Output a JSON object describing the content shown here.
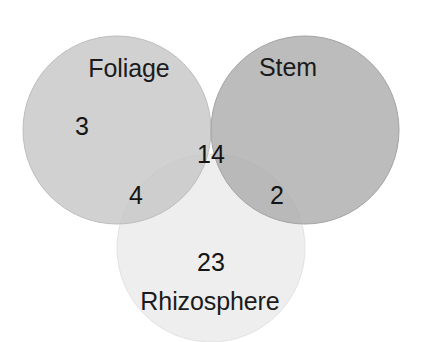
{
  "figure": {
    "type": "venn-diagram",
    "width": 421,
    "height": 342,
    "background_color": "#ffffff"
  },
  "chart_data": {
    "type": "venn",
    "title": "",
    "xlabel": "",
    "ylabel": "",
    "grid": false,
    "legend_position": "none",
    "sets": [
      {
        "key": "foliage",
        "label": "Foliage",
        "color": "#c9c9c9",
        "center": [
          117,
          130
        ],
        "radius": 94,
        "exclusive_count": 3
      },
      {
        "key": "stem",
        "label": "Stem",
        "color": "#b4b4b4",
        "center": [
          305,
          130
        ],
        "radius": 94,
        "exclusive_count": null
      },
      {
        "key": "rhizosphere",
        "label": "Rhizosphere",
        "color": "#f0f0f0",
        "center": [
          211,
          248
        ],
        "radius": 94,
        "exclusive_count": 23
      }
    ],
    "regions": [
      {
        "key": "foliage-only",
        "sets": [
          "foliage"
        ],
        "value": 3,
        "position": [
          82,
          126
        ]
      },
      {
        "key": "foliage-rhizosphere",
        "sets": [
          "foliage",
          "rhizosphere"
        ],
        "value": 4,
        "position": [
          136,
          195
        ]
      },
      {
        "key": "foliage-stem-rhizosphere",
        "sets": [
          "foliage",
          "stem",
          "rhizosphere"
        ],
        "value": 14,
        "position": [
          211,
          154
        ]
      },
      {
        "key": "stem-rhizosphere",
        "sets": [
          "stem",
          "rhizosphere"
        ],
        "value": 2,
        "position": [
          277,
          195
        ]
      },
      {
        "key": "rhizosphere-only",
        "sets": [
          "rhizosphere"
        ],
        "value": 23,
        "position": [
          211,
          262
        ]
      }
    ],
    "set_labels": [
      {
        "key": "foliage",
        "text": "Foliage",
        "position": [
          129,
          68
        ]
      },
      {
        "key": "stem",
        "text": "Stem",
        "position": [
          288,
          67
        ]
      },
      {
        "key": "rhizosphere",
        "text": "Rhizosphere",
        "position": [
          210,
          301
        ]
      }
    ],
    "counts": {
      "foliage_only": 3,
      "foliage_rhizosphere": 4,
      "triple_intersection": 14,
      "stem_rhizosphere": 2,
      "rhizosphere_only": 23
    }
  }
}
